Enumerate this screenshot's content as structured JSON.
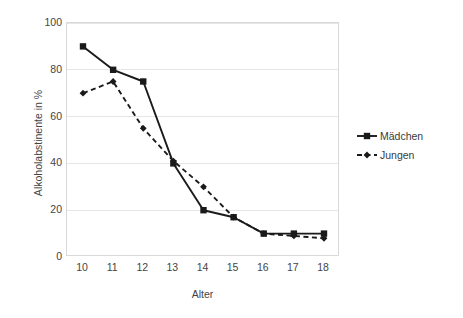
{
  "chart_data": {
    "type": "line",
    "title": "",
    "xlabel": "Alter",
    "ylabel": "Alkoholabstinente in %",
    "x": [
      10,
      11,
      12,
      13,
      14,
      15,
      16,
      17,
      18
    ],
    "xtick_labels": [
      "10",
      "11",
      "12",
      "13",
      "14",
      "15",
      "16",
      "17",
      "18"
    ],
    "ytick_labels": [
      "0",
      "20",
      "40",
      "60",
      "80",
      "100"
    ],
    "yticks": [
      0,
      20,
      40,
      60,
      80,
      100
    ],
    "xlim": [
      10,
      18
    ],
    "ylim": [
      0,
      100
    ],
    "grid": "horizontal",
    "legend_position": "right",
    "series": [
      {
        "name": "Mädchen",
        "values": [
          90,
          80,
          75,
          40,
          20,
          17,
          10,
          10,
          10
        ],
        "color": "#1a1a1a",
        "line_style": "solid",
        "marker": "square"
      },
      {
        "name": "Jungen",
        "values": [
          70,
          75,
          55,
          41,
          30,
          17,
          10,
          9,
          8
        ],
        "color": "#1a1a1a",
        "line_style": "dashed",
        "marker": "diamond"
      }
    ]
  },
  "legend": {
    "items": [
      {
        "label": "Mädchen"
      },
      {
        "label": "Jungen"
      }
    ]
  },
  "colors": {
    "series": "#1a1a1a",
    "gridline": "#e6e6e6",
    "plot_border": "#d9d9d9",
    "text": "#444444",
    "background": "#ffffff"
  }
}
